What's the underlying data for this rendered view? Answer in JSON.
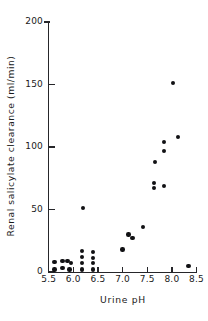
{
  "chart_data": {
    "type": "scatter",
    "title": "",
    "xlabel": "Urine  pH",
    "ylabel": "Renal  salicylate  clearance  (ml/min)",
    "xlim": [
      5.5,
      8.5
    ],
    "ylim": [
      0,
      200
    ],
    "xticks": [
      5.5,
      6.0,
      6.5,
      7.0,
      7.5,
      8.0,
      8.5
    ],
    "yticks": [
      0,
      50,
      100,
      150,
      200
    ],
    "xticklabels": [
      "5.5",
      "6.0",
      "6.5",
      "7.0",
      "7.5",
      "8.0",
      "8.5"
    ],
    "yticklabels": [
      "0",
      "50",
      "100",
      "150",
      "200"
    ],
    "grid": false,
    "legend": null,
    "marker": "filled-circle",
    "marker_color": "#111114",
    "points": [
      {
        "x": 5.62,
        "y": 8
      },
      {
        "x": 5.62,
        "y": 2
      },
      {
        "x": 5.78,
        "y": 9
      },
      {
        "x": 5.78,
        "y": 3
      },
      {
        "x": 5.88,
        "y": 9
      },
      {
        "x": 5.92,
        "y": 2
      },
      {
        "x": 5.95,
        "y": 7
      },
      {
        "x": 6.18,
        "y": 17
      },
      {
        "x": 6.18,
        "y": 12
      },
      {
        "x": 6.18,
        "y": 7
      },
      {
        "x": 6.18,
        "y": 2
      },
      {
        "x": 6.4,
        "y": 16
      },
      {
        "x": 6.4,
        "y": 11
      },
      {
        "x": 6.4,
        "y": 7
      },
      {
        "x": 6.4,
        "y": 2
      },
      {
        "x": 6.2,
        "y": 51
      },
      {
        "x": 7.0,
        "y": 18
      },
      {
        "x": 7.12,
        "y": 30
      },
      {
        "x": 7.2,
        "y": 27
      },
      {
        "x": 7.42,
        "y": 36
      },
      {
        "x": 7.64,
        "y": 71
      },
      {
        "x": 7.64,
        "y": 67
      },
      {
        "x": 7.84,
        "y": 69
      },
      {
        "x": 7.66,
        "y": 88
      },
      {
        "x": 7.84,
        "y": 104
      },
      {
        "x": 7.84,
        "y": 97
      },
      {
        "x": 8.02,
        "y": 151
      },
      {
        "x": 8.12,
        "y": 108
      },
      {
        "x": 8.34,
        "y": 5
      }
    ]
  },
  "geometry": {
    "plot_left_px": 48.7,
    "plot_right_px": 196.5,
    "plot_top_px": 22,
    "plot_bottom_px": 272
  }
}
